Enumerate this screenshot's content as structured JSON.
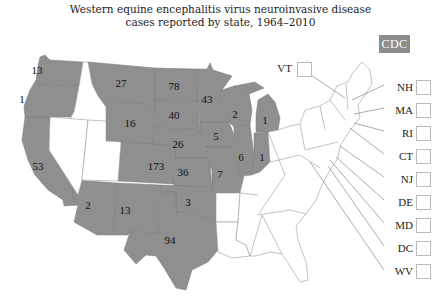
{
  "title": {
    "line1": "Western equine encephalitis virus neuroinvasive disease",
    "line2": "cases reported by state, 1964–2010"
  },
  "logo": {
    "text": "CDC",
    "color": "#8c8c8c"
  },
  "colors": {
    "reported": "#8f8f8f",
    "none": "#ffffff",
    "border": "#9a9a9a"
  },
  "states": [
    {
      "name": "WA",
      "value": "13",
      "x": 37,
      "y": 74
    },
    {
      "name": "OR",
      "value": "1",
      "x": 22,
      "y": 103
    },
    {
      "name": "CA",
      "value": "53",
      "x": 38,
      "y": 170
    },
    {
      "name": "MT",
      "value": "27",
      "x": 121,
      "y": 87
    },
    {
      "name": "WY",
      "value": "16",
      "x": 130,
      "y": 127
    },
    {
      "name": "CO",
      "value": "173",
      "x": 156,
      "y": 170
    },
    {
      "name": "ND",
      "value": "78",
      "x": 174,
      "y": 90
    },
    {
      "name": "SD",
      "value": "40",
      "x": 174,
      "y": 119
    },
    {
      "name": "NE",
      "value": "26",
      "x": 178,
      "y": 148
    },
    {
      "name": "KS",
      "value": "36",
      "x": 183,
      "y": 176
    },
    {
      "name": "MN",
      "value": "43",
      "x": 207,
      "y": 103
    },
    {
      "name": "IA",
      "value": "5",
      "x": 216,
      "y": 140
    },
    {
      "name": "MO",
      "value": "7",
      "x": 220,
      "y": 178
    },
    {
      "name": "WI",
      "value": "2",
      "x": 235,
      "y": 118
    },
    {
      "name": "IL",
      "value": "6",
      "x": 241,
      "y": 161
    },
    {
      "name": "IN",
      "value": "1",
      "x": 262,
      "y": 161
    },
    {
      "name": "MI",
      "value": "1",
      "x": 265,
      "y": 124
    },
    {
      "name": "AZ",
      "value": "2",
      "x": 88,
      "y": 209
    },
    {
      "name": "NM",
      "value": "13",
      "x": 125,
      "y": 214
    },
    {
      "name": "OK",
      "value": "3",
      "x": 188,
      "y": 206
    },
    {
      "name": "TX",
      "value": "94",
      "x": 170,
      "y": 244
    }
  ],
  "small_states": [
    {
      "name": "VT",
      "label_x": 280,
      "label_y": 69,
      "box_x": 297,
      "box_y": 62
    },
    {
      "name": "NH",
      "label_x": 384,
      "label_y": 88,
      "box_x": 416,
      "box_y": 80
    },
    {
      "name": "MA",
      "label_x": 384,
      "label_y": 111,
      "box_x": 416,
      "box_y": 103
    },
    {
      "name": "RI",
      "label_x": 384,
      "label_y": 134,
      "box_x": 416,
      "box_y": 126
    },
    {
      "name": "CT",
      "label_x": 384,
      "label_y": 157,
      "box_x": 416,
      "box_y": 149
    },
    {
      "name": "NJ",
      "label_x": 384,
      "label_y": 180,
      "box_x": 416,
      "box_y": 172
    },
    {
      "name": "DE",
      "label_x": 384,
      "label_y": 203,
      "box_x": 416,
      "box_y": 195
    },
    {
      "name": "MD",
      "label_x": 384,
      "label_y": 226,
      "box_x": 416,
      "box_y": 218
    },
    {
      "name": "DC",
      "label_x": 384,
      "label_y": 249,
      "box_x": 416,
      "box_y": 241
    },
    {
      "name": "WV",
      "label_x": 384,
      "label_y": 272,
      "box_x": 416,
      "box_y": 264
    }
  ]
}
